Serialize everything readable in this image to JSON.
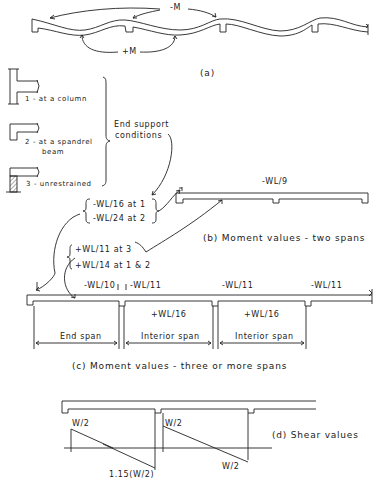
{
  "part_a": {
    "neg_moment": "-M",
    "pos_moment": "+M",
    "caption": "(a)"
  },
  "supports": {
    "items": [
      {
        "label": "1 - at a column"
      },
      {
        "label": "2 - at a spandrel"
      },
      {
        "label": "beam"
      },
      {
        "label": "3 - unrestrained"
      }
    ],
    "brace_label_line1": "End support",
    "brace_label_line2": "conditions"
  },
  "end_moments": {
    "at1": "-WL/16 at 1",
    "at2": "-WL/24 at 2"
  },
  "end_span_positive": {
    "at3": "+WL/11 at 3",
    "at12": "+WL/14 at 1 & 2"
  },
  "part_b": {
    "support_moment": "-WL/9",
    "caption": "(b) Moment values - two spans"
  },
  "part_c": {
    "moments_top": [
      "-WL/10",
      "-WL/11",
      "-WL/11",
      "-WL/11"
    ],
    "moments_mid": [
      "+WL/16",
      "+WL/16"
    ],
    "spans": [
      "End span",
      "Interior span",
      "Interior span"
    ],
    "caption": "(c) Moment values - three or more spans"
  },
  "part_d": {
    "shear_labels": [
      "W/2",
      "1.15(W/2)",
      "W/2",
      "W/2"
    ],
    "caption": "(d) Shear values"
  }
}
